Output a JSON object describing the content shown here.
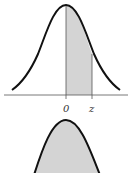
{
  "diagram": {
    "top": {
      "type": "normal-curve-shaded",
      "labels": {
        "origin": "0",
        "z": "z"
      },
      "shade_from": "0",
      "shade_to": "z"
    },
    "bottom": {
      "type": "normal-curve-fully-shaded"
    },
    "colors": {
      "curve": "#111111",
      "shade": "#d4d4d4",
      "axis": "#555555"
    }
  }
}
